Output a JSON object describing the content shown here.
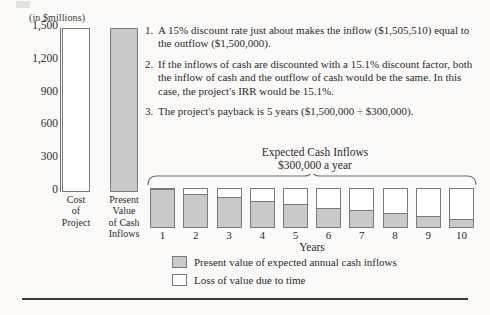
{
  "axis_unit_caption": "(in $millions)",
  "notes": [
    {
      "num": "1.",
      "text": "A 15% discount rate just about makes the inflow ($1,505,510) equal to the outflow ($1,500,000)."
    },
    {
      "num": "2.",
      "text": "If the inflows of cash are discounted with a 15.1% discount factor, both the inflow of cash and the outflow of cash would be the same. In this case, the project's IRR would be 15.1%."
    },
    {
      "num": "3.",
      "text": "The project's payback is 5 years ($1,500,000 ÷ $300,000)."
    }
  ],
  "inflow_title_line1": "Expected Cash Inflows",
  "inflow_title_line2": "$300,000 a year",
  "years_axis_label": "Years",
  "legend": [
    {
      "swatch": "gray",
      "label": "Present value of expected annual cash inflows"
    },
    {
      "swatch": "white",
      "label": "Loss of value due to time"
    }
  ],
  "colors": {
    "gray_fill": "#c9c9c9",
    "white_fill": "#ffffff",
    "outline": "#7a7a7a",
    "text": "#2b2b2b",
    "background": "#fbfaf8",
    "rule": "#3a3a38"
  },
  "chart_data": [
    {
      "type": "bar",
      "title": "",
      "ylabel": "(in $millions)",
      "xlabel": "",
      "ylim": [
        0,
        1500
      ],
      "yticks": [
        "0",
        "300",
        "600",
        "900",
        "1,200",
        "1,500"
      ],
      "ytick_values": [
        0,
        300,
        600,
        900,
        1200,
        1500
      ],
      "grid": false,
      "categories": [
        "Cost of Project",
        "Present Value of Cash Inflows"
      ],
      "category_lines": [
        [
          "Cost",
          "of",
          "Project"
        ],
        [
          "Present",
          "Value",
          "of Cash",
          "Inflows"
        ]
      ],
      "values": [
        1500,
        1500
      ],
      "bar_styles": [
        "white",
        "gray"
      ]
    },
    {
      "type": "bar",
      "title": "Expected Cash Inflows $300,000 a year",
      "xlabel": "Years",
      "ylabel": "",
      "grid": false,
      "stacked": true,
      "ylim": [
        0,
        100
      ],
      "categories": [
        "1",
        "2",
        "3",
        "4",
        "5",
        "6",
        "7",
        "8",
        "9",
        "10"
      ],
      "series": [
        {
          "name": "Present value of expected annual cash inflows",
          "values": [
            92,
            80,
            72,
            62,
            55,
            46,
            40,
            33,
            25,
            18
          ]
        },
        {
          "name": "Loss of value due to time",
          "values": [
            8,
            20,
            28,
            38,
            45,
            54,
            60,
            67,
            75,
            82
          ]
        }
      ]
    }
  ]
}
